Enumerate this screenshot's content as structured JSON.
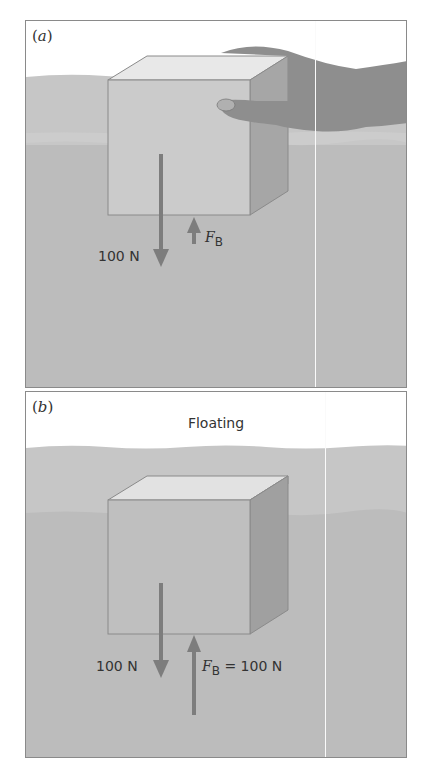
{
  "figure": {
    "panels": [
      {
        "id": "a",
        "label": "a",
        "caption": "",
        "weight_label": "100 N",
        "buoyant_label_symbol": "F",
        "buoyant_label_subscript": "B",
        "buoyant_label_value": "",
        "description": "Block held partly submerged by a hand"
      },
      {
        "id": "b",
        "label": "b",
        "caption": "Floating",
        "weight_label": "100 N",
        "buoyant_label_symbol": "F",
        "buoyant_label_subscript": "B",
        "buoyant_label_value": " = 100 N",
        "description": "Block floating with most of its volume submerged"
      }
    ],
    "colors": {
      "water_surface_band": "#c4c4c4",
      "water_deep": "#bdbdbd",
      "block_front": "#c9c9c9",
      "block_top": "#e6e6e6",
      "block_side": "#9e9e9e",
      "arrow": "#7d7d7d",
      "hand": "#8e8e8e",
      "frame": "#8a8a8a"
    }
  }
}
